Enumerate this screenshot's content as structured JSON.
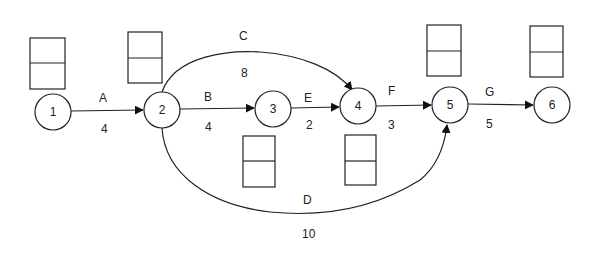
{
  "diagram": {
    "type": "activity-on-arrow network",
    "nodes": [
      {
        "id": "1",
        "label": "1",
        "cx": 53,
        "cy": 112
      },
      {
        "id": "2",
        "label": "2",
        "cx": 162,
        "cy": 110
      },
      {
        "id": "3",
        "label": "3",
        "cx": 273,
        "cy": 109
      },
      {
        "id": "4",
        "label": "4",
        "cx": 358,
        "cy": 106
      },
      {
        "id": "5",
        "label": "5",
        "cx": 450,
        "cy": 105
      },
      {
        "id": "6",
        "label": "6",
        "cx": 552,
        "cy": 105
      }
    ],
    "activities": [
      {
        "name": "A",
        "from": "1",
        "to": "2",
        "duration": "4"
      },
      {
        "name": "B",
        "from": "2",
        "to": "3",
        "duration": "4"
      },
      {
        "name": "C",
        "from": "2",
        "to": "4",
        "duration": "8"
      },
      {
        "name": "D",
        "from": "2",
        "to": "5",
        "duration": "10"
      },
      {
        "name": "E",
        "from": "3",
        "to": "4",
        "duration": "2"
      },
      {
        "name": "F",
        "from": "4",
        "to": "5",
        "duration": "3"
      },
      {
        "name": "G",
        "from": "5",
        "to": "6",
        "duration": "5"
      }
    ],
    "time_boxes": [
      {
        "node": "1",
        "top": "",
        "bottom": ""
      },
      {
        "node": "2",
        "top": "",
        "bottom": ""
      },
      {
        "node": "3",
        "top": "",
        "bottom": ""
      },
      {
        "node": "4",
        "top": "",
        "bottom": ""
      },
      {
        "node": "5",
        "top": "",
        "bottom": ""
      },
      {
        "node": "6",
        "top": "",
        "bottom": ""
      }
    ]
  }
}
